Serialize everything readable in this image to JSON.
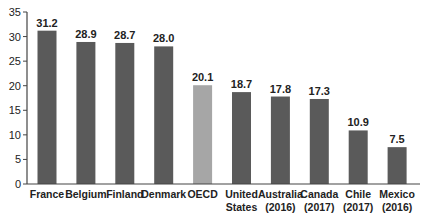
{
  "chart_data": {
    "type": "bar",
    "title": "",
    "xlabel": "",
    "ylabel": "",
    "ylim": [
      0,
      35
    ],
    "yticks": [
      0,
      5,
      10,
      15,
      20,
      25,
      30,
      35
    ],
    "grid": false,
    "legend": null,
    "categories": [
      [
        "France"
      ],
      [
        "Belgium"
      ],
      [
        "Finland"
      ],
      [
        "Denmark"
      ],
      [
        "OECD"
      ],
      [
        "United",
        "States"
      ],
      [
        "Australia",
        "(2016)"
      ],
      [
        "Canada",
        "(2017)"
      ],
      [
        "Chile",
        "(2017)"
      ],
      [
        "Mexico",
        "(2016)"
      ]
    ],
    "values": [
      31.2,
      28.9,
      28.7,
      28.0,
      20.1,
      18.7,
      17.8,
      17.3,
      10.9,
      7.5
    ],
    "value_labels": [
      "31.2",
      "28.9",
      "28.7",
      "28.0",
      "20.1",
      "18.7",
      "17.8",
      "17.3",
      "10.9",
      "7.5"
    ],
    "highlight_index": 4,
    "colors": {
      "bar": "#5a5a5a",
      "highlight": "#a6a6a6",
      "axis": "#444444",
      "text": "#222222"
    }
  }
}
